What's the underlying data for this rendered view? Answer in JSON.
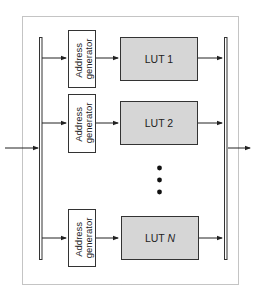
{
  "diagram": {
    "title": "",
    "frame": {
      "style": "dotted"
    },
    "address_generators": [
      {
        "line1": "Address",
        "line2": "generator"
      },
      {
        "line1": "Address",
        "line2": "generator"
      },
      {
        "line1": "Address",
        "line2": "generator"
      }
    ],
    "luts": [
      {
        "prefix": "LUT ",
        "index": "1"
      },
      {
        "prefix": "LUT ",
        "index": "2"
      },
      {
        "prefix": "LUT ",
        "index": "N"
      }
    ],
    "ellipsis": "•••",
    "colors": {
      "lut_fill": "#d6d6d6",
      "stroke": "#333333",
      "frame": "#888888",
      "background": "#ffffff"
    }
  }
}
